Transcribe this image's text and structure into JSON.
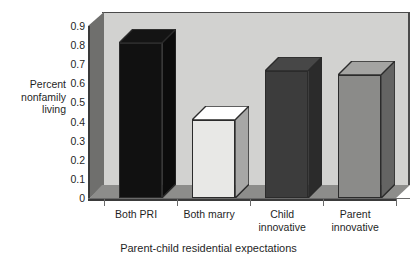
{
  "chart_data": {
    "type": "bar",
    "title": "",
    "subtitle": "",
    "xlabel": "Parent-child residential expectations",
    "ylabel": "Percent\nnonfamily\nliving",
    "categories": [
      "Both PRI",
      "Both marry",
      "Child\ninnovative",
      "Parent\ninnovative"
    ],
    "values": [
      0.81,
      0.41,
      0.665,
      0.645
    ],
    "ylim": [
      0,
      0.9
    ],
    "ytick_labels": [
      "0.9",
      "0.8",
      "0.7",
      "0.6",
      "0.5",
      "0.4",
      "0.3",
      "0.2",
      "0.1",
      "0"
    ],
    "ytick_values": [
      0.9,
      0.8,
      0.7,
      0.6,
      0.5,
      0.4,
      0.3,
      0.2,
      0.1,
      0
    ],
    "grid": false,
    "legend": "none",
    "style": "3d-perspective",
    "bar_colors": [
      "#111111",
      "#e8e8e6",
      "#3c3c3c",
      "#8b8b89"
    ],
    "plot_background": "#d2d2d0",
    "floor_color": "#8d8d8b",
    "wall_color": "#6f6f6d",
    "outline_color": "#2b2b2b"
  },
  "axes": {
    "y_title": "Percent\nnonfamily\nliving",
    "x_title": "Parent-child residential expectations"
  }
}
